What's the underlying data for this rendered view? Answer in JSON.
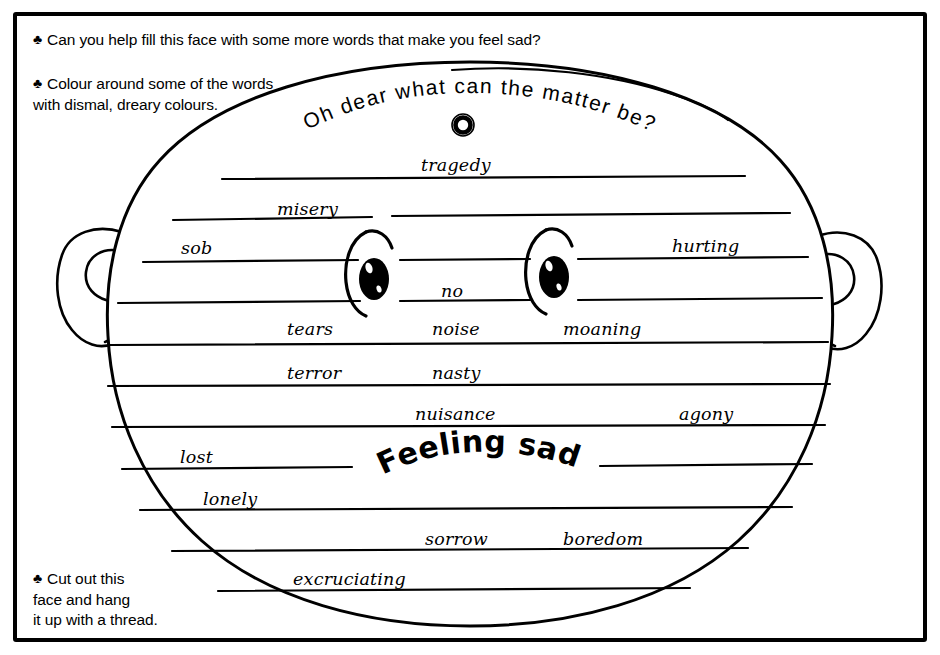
{
  "worksheet": {
    "title": "Feeling sad",
    "banner": "Oh dear what can the matter be?",
    "bullet_glyph": "♣"
  },
  "instructions": [
    {
      "id": "help-fill",
      "text": "Can you help fill this face with some more words that make you feel sad?"
    },
    {
      "id": "colour-around",
      "line1": "Colour around some of the words",
      "line2": "with dismal, dreary colours."
    },
    {
      "id": "cut-out",
      "line1": "Cut out this",
      "line2": "face and hang",
      "line3": "it up with a thread."
    }
  ],
  "words": [
    {
      "text": "tragedy",
      "x": 421,
      "y": 155
    },
    {
      "text": "misery",
      "x": 277,
      "y": 199
    },
    {
      "text": "sob",
      "x": 181,
      "y": 238
    },
    {
      "text": "hurting",
      "x": 672,
      "y": 236
    },
    {
      "text": "no",
      "x": 441,
      "y": 281
    },
    {
      "text": "tears",
      "x": 287,
      "y": 319
    },
    {
      "text": "noise",
      "x": 432,
      "y": 319
    },
    {
      "text": "moaning",
      "x": 563,
      "y": 319
    },
    {
      "text": "terror",
      "x": 287,
      "y": 363
    },
    {
      "text": "nasty",
      "x": 432,
      "y": 363
    },
    {
      "text": "nuisance",
      "x": 415,
      "y": 404
    },
    {
      "text": "agony",
      "x": 679,
      "y": 404
    },
    {
      "text": "lost",
      "x": 180,
      "y": 447
    },
    {
      "text": "lonely",
      "x": 203,
      "y": 489
    },
    {
      "text": "sorrow",
      "x": 425,
      "y": 529
    },
    {
      "text": "boredom",
      "x": 563,
      "y": 529
    },
    {
      "text": "excruciating",
      "x": 293,
      "y": 569
    }
  ],
  "colors": {
    "ink": "#000000",
    "paper": "#ffffff"
  },
  "icons": {
    "hole_punch": "hole-punch-ring",
    "left_ear": "left-ear",
    "right_ear": "right-ear",
    "left_eye": "left-eye",
    "right_eye": "right-eye"
  }
}
